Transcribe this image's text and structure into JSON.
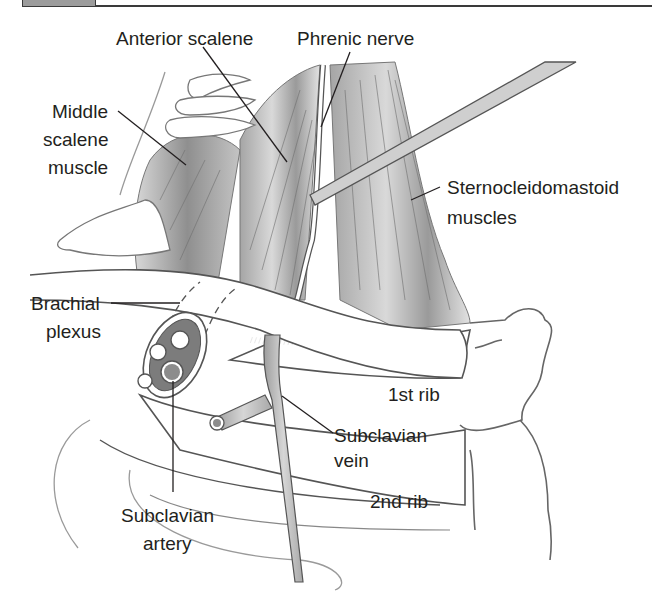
{
  "figure": {
    "header_bar": {
      "box_color": "#9c9c9c",
      "line_color": "#3a3a3a"
    },
    "colors": {
      "outline": "#555555",
      "muscle_dark": "#8a8a8a",
      "muscle_light": "#c8c8c8",
      "vessel_fill": "#bdbdbd",
      "artery_lumen": "#8c8c8c",
      "leader_line": "#231f20",
      "background": "#ffffff"
    },
    "labels": {
      "anterior_scalene": "Anterior scalene",
      "phrenic_nerve": "Phrenic nerve",
      "middle_scalene": [
        "Middle",
        "scalene",
        "muscle"
      ],
      "sternocleidomastoid": [
        "Sternocleidomastoid",
        "muscles"
      ],
      "brachial_plexus": [
        "Brachial",
        "plexus"
      ],
      "first_rib": "1st rib",
      "subclavian_vein": [
        "Subclavian",
        "vein"
      ],
      "second_rib": "2nd rib",
      "subclavian_artery": [
        "Subclavian",
        "artery"
      ]
    }
  }
}
